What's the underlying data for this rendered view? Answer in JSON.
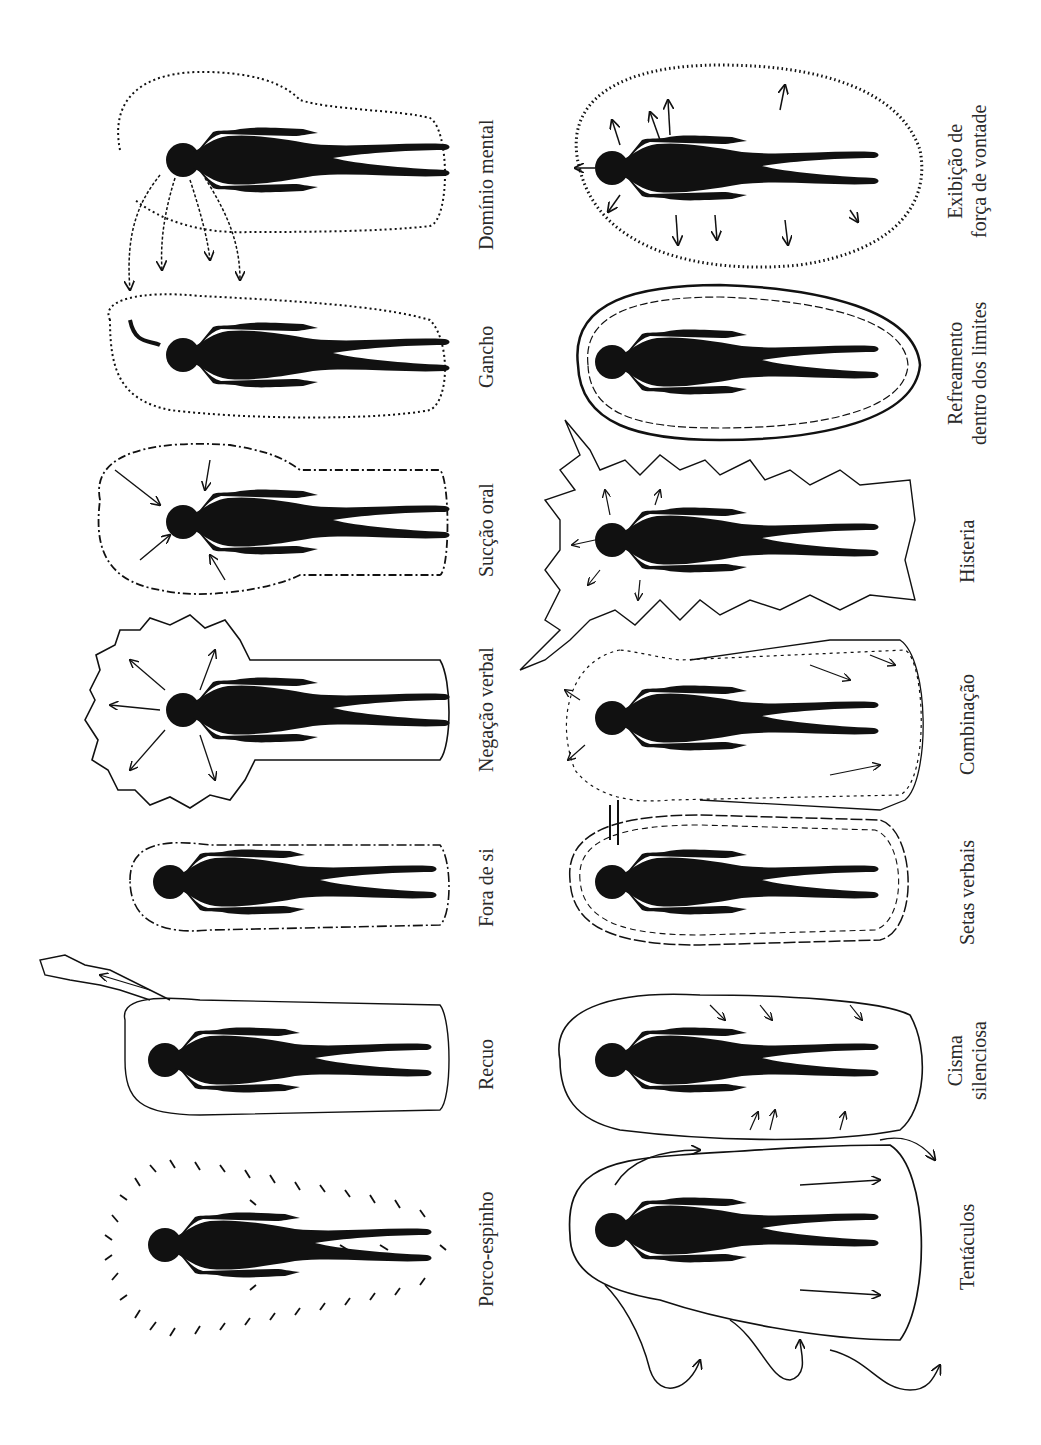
{
  "figure": {
    "orientation": "rotated-90-ccw",
    "ink_color": "#111111",
    "paper_color": "#ffffff"
  },
  "columns": [
    {
      "name": "left",
      "figures": [
        {
          "id": "dominio-mental",
          "label": "Domínio mental",
          "style": "dotted-field-with-hands",
          "y_center": 170
        },
        {
          "id": "gancho",
          "label": "Gancho",
          "style": "dotted-field-hook",
          "y_center": 355
        },
        {
          "id": "succao-oral",
          "label": "Sucção oral",
          "style": "rough-head-field-inward-arrows",
          "y_center": 520
        },
        {
          "id": "negacao-verbal",
          "label": "Negação verbal",
          "style": "spiky-head-field-outward-arrows",
          "y_center": 710
        },
        {
          "id": "fora-de-si",
          "label": "Fora de si",
          "style": "dashed-compact-field",
          "y_center": 880
        },
        {
          "id": "recuo",
          "label": "Recuo",
          "style": "wavy-field-with-escape",
          "y_center": 1060
        },
        {
          "id": "porco-espinho",
          "label": "Porco-espinho",
          "style": "quill-marks",
          "y_center": 1240
        }
      ]
    },
    {
      "name": "right",
      "figures": [
        {
          "id": "exibicao-forca-vontade",
          "label": "Exibição de",
          "label_line2": "força de vontade",
          "style": "hatched-oval-outward-arrows",
          "y_center": 160
        },
        {
          "id": "refreamento",
          "label": "Refreamento",
          "label_line2": "dentro dos limites",
          "style": "double-line-oval",
          "y_center": 365
        },
        {
          "id": "histeria",
          "label": "Histeria",
          "style": "jagged-lightning-field",
          "y_center": 545
        },
        {
          "id": "combinacao",
          "label": "Combinação",
          "style": "mixed-field",
          "y_center": 720
        },
        {
          "id": "setas-verbais",
          "label": "Setas verbais",
          "style": "dashed-oval",
          "y_center": 880
        },
        {
          "id": "cisma-silenciosa",
          "label": "Cisma",
          "label_line2": "silenciosa",
          "style": "wavy-oval-inward-arrows",
          "y_center": 1060
        },
        {
          "id": "tentaculos",
          "label": "Tentáculos",
          "style": "large-field-with-tentacles",
          "y_center": 1240
        }
      ]
    }
  ]
}
